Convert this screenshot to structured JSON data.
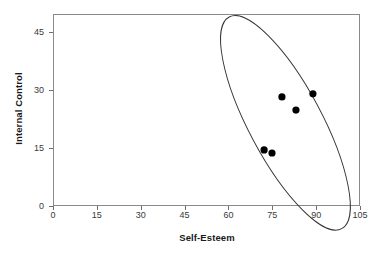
{
  "chart_data": {
    "type": "scatter",
    "title": "",
    "xlabel": "Self-Esteem",
    "ylabel": "Internal Control",
    "xlim": [
      0,
      105
    ],
    "ylim": [
      0,
      48.5
    ],
    "xticks": [
      0,
      15,
      30,
      45,
      60,
      75,
      90,
      105
    ],
    "yticks": [
      0,
      15,
      30,
      45
    ],
    "xticklabels": [
      "0",
      "15",
      "30",
      "45",
      "60",
      "75",
      "90",
      "105"
    ],
    "yticklabels": [
      "0",
      "15",
      "30",
      "45"
    ],
    "grid": false,
    "legend": null,
    "series": [
      {
        "name": "observations",
        "marker": "filled-circle",
        "color": "#000000",
        "points": [
          {
            "x": 72.2,
            "y": 14.5
          },
          {
            "x": 74.9,
            "y": 13.7
          },
          {
            "x": 78.3,
            "y": 28.2
          },
          {
            "x": 83.1,
            "y": 24.8
          },
          {
            "x": 88.9,
            "y": 29.0
          }
        ]
      }
    ],
    "annotations": [
      {
        "type": "ellipse",
        "name": "cluster-ellipse",
        "center_x": 79.5,
        "center_y": 21.5,
        "radius_x": 12.5,
        "radius_y": 31.0,
        "rotation_deg": -28,
        "stroke": "#333333",
        "fill": "none"
      }
    ],
    "colors": {
      "marker": "#000000",
      "frame": "#8a8a8a",
      "tick": "#6f6f6f",
      "text": "#3a3a3a",
      "axis_title": "#1a1a1a",
      "background": "#ffffff"
    }
  }
}
